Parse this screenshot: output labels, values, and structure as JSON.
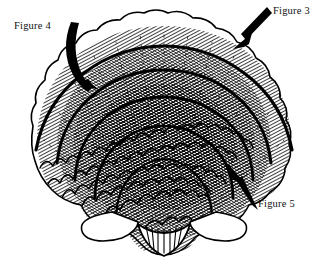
{
  "page": {
    "background_color": "#ffffff",
    "ink_color": "#000000",
    "width": 328,
    "height": 273
  },
  "illustration": {
    "name": "scallop-shell-line-drawing",
    "description": "Black ink line drawing of a scallop shell seen from the front, with many concentric scalloped growth ridges radiating from a pointed umbo at the bottom center and wing-like ears at the lower left and right",
    "subject": "scallop shell",
    "style": "pen-and-ink hatched line art",
    "ring_count": 6
  },
  "annotations": [
    {
      "id": "figure-4",
      "label": "Figure 4",
      "arrow_type": "curved",
      "points_to": "upper-left growth ridge",
      "label_x": 14,
      "label_y": 20,
      "tail_x": 82,
      "tail_y": 25,
      "head_x": 93,
      "head_y": 88
    },
    {
      "id": "figure-3",
      "label": "Figure 3",
      "arrow_type": "straight",
      "points_to": "upper-right outer margin",
      "label_x": 273,
      "label_y": 5,
      "tail_x": 266,
      "tail_y": 9,
      "head_x": 236,
      "head_y": 46
    },
    {
      "id": "figure-5",
      "label": "Figure 5",
      "arrow_type": "straight",
      "points_to": "lower-right ridge near the ear",
      "label_x": 258,
      "label_y": 198,
      "tail_x": 256,
      "tail_y": 207,
      "head_x": 228,
      "head_y": 164
    }
  ],
  "colors": {
    "ink": "#000000",
    "paper": "#ffffff",
    "text": "#111111"
  }
}
